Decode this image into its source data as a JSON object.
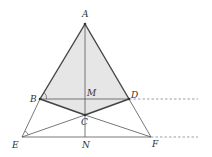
{
  "diagram": {
    "type": "geometry",
    "points": {
      "A": {
        "label": "A",
        "x": 85,
        "y": 24,
        "lx": 82,
        "ly": 17
      },
      "B": {
        "label": "B",
        "x": 40,
        "y": 99,
        "lx": 30,
        "ly": 102
      },
      "D": {
        "label": "D",
        "x": 129,
        "y": 99,
        "lx": 131,
        "ly": 98
      },
      "M": {
        "label": "M",
        "x": 85,
        "y": 99,
        "lx": 88,
        "ly": 96
      },
      "C": {
        "label": "C",
        "x": 85,
        "y": 115,
        "lx": 81,
        "ly": 125
      },
      "E": {
        "label": "E",
        "x": 22,
        "y": 137,
        "lx": 12,
        "ly": 147
      },
      "N": {
        "label": "N",
        "x": 85,
        "y": 137,
        "lx": 82,
        "ly": 148
      },
      "F": {
        "label": "F",
        "x": 151,
        "y": 137,
        "lx": 152,
        "ly": 147
      }
    },
    "shaded_region": [
      "A",
      "B",
      "C",
      "D"
    ],
    "shade_color": "#e6e6e6",
    "thick_segments": [
      [
        "A",
        "B"
      ],
      [
        "A",
        "D"
      ],
      [
        "B",
        "C"
      ],
      [
        "C",
        "D"
      ]
    ],
    "thin_segments": [
      [
        "B",
        "D"
      ],
      [
        "A",
        "N"
      ],
      [
        "B",
        "E"
      ],
      [
        "D",
        "F"
      ],
      [
        "E",
        "F"
      ],
      [
        "E",
        "C"
      ],
      [
        "C",
        "F"
      ]
    ],
    "dashed_rays": [
      {
        "from": "D",
        "to_x": 198
      },
      {
        "from": "F",
        "to_x": 198
      }
    ],
    "angle_marks": [
      "B",
      "E"
    ],
    "line_color": "#555555",
    "thick_color": "#444444"
  }
}
